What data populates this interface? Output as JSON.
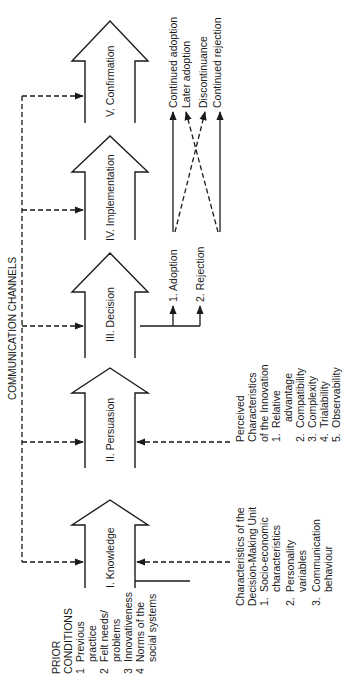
{
  "diagram": {
    "channel_label": "COMMUNICATION CHANNELS",
    "prior_conditions": {
      "heading_line1": "PRIOR",
      "heading_line2": "CONDITIONS",
      "items": [
        {
          "num": "1",
          "line1": "Previous",
          "line2": "practice"
        },
        {
          "num": "2",
          "line1": "Felt needs/",
          "line2": "problems"
        },
        {
          "num": "3",
          "line1": "Innovativeness",
          "line2": ""
        },
        {
          "num": "4",
          "line1": "Norms of the",
          "line2": "social systems"
        }
      ]
    },
    "stages": [
      {
        "label": "I. Knowledge"
      },
      {
        "label": "II. Persuasion"
      },
      {
        "label": "III. Decision"
      },
      {
        "label": "IV. Implementation"
      },
      {
        "label": "V. Confirmation"
      }
    ],
    "decision_outcomes": [
      {
        "label": "1.  Adoption"
      },
      {
        "label": "2.  Rejection"
      }
    ],
    "confirmation_outcomes": [
      {
        "label": "Continued adoption"
      },
      {
        "label": "Later adoption"
      },
      {
        "label": "Discontinuance"
      },
      {
        "label": "Continued rejection"
      }
    ],
    "decision_unit": {
      "heading_line1": "Characteristics of the",
      "heading_line2": "Decision-Making Unit",
      "items": [
        {
          "num": "1.",
          "line1": "Socio-economic",
          "line2": "characteristics"
        },
        {
          "num": "2.",
          "line1": "Personality",
          "line2": "variables"
        },
        {
          "num": "3.",
          "line1": "Communication",
          "line2": "behaviour"
        }
      ]
    },
    "innovation_characteristics": {
      "heading_line1": "Perceived",
      "heading_line2": "Characteristics",
      "heading_line3": "of the Innovation",
      "items": [
        {
          "num": "1.",
          "line1": "Relative",
          "line2": "advantage"
        },
        {
          "num": "2.",
          "line1": "Compatibility",
          "line2": ""
        },
        {
          "num": "3.",
          "line1": "Complexity",
          "line2": ""
        },
        {
          "num": "4.",
          "line1": "Trialability",
          "line2": ""
        },
        {
          "num": "5.",
          "line1": "Observability",
          "line2": ""
        }
      ]
    },
    "colors": {
      "ink": "#1a1a1a",
      "background": "#ffffff"
    }
  }
}
